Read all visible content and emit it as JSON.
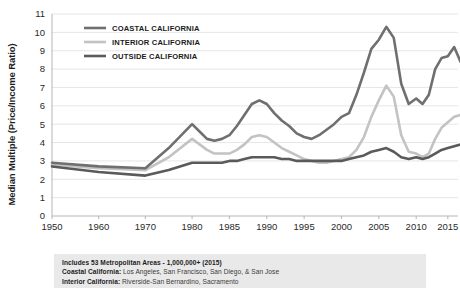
{
  "chart_data": {
    "type": "line",
    "title": "",
    "xlabel": "",
    "ylabel": "Median Multiple (Price/Income Ratio)",
    "ylim": [
      0,
      11
    ],
    "ytick_labels": [
      "0",
      "1",
      "2",
      "3",
      "4",
      "5",
      "6",
      "7",
      "8",
      "9",
      "10",
      "11"
    ],
    "ytick_values": [
      0,
      1,
      2,
      3,
      4,
      5,
      6,
      7,
      8,
      9,
      10,
      11
    ],
    "xtick_labels": [
      "1950",
      "1960",
      "1970",
      "1980",
      "1985",
      "1990",
      "1995",
      "2000",
      "2005",
      "2010",
      "2015"
    ],
    "xtick_values": [
      1950,
      1960,
      1970,
      1980,
      1985,
      1990,
      1995,
      2000,
      2005,
      2010,
      2015
    ],
    "xlim": [
      1950,
      2017
    ],
    "grid": true,
    "legend_position": "top-left",
    "x": [
      1950,
      1960,
      1970,
      1975,
      1980,
      1981,
      1982,
      1983,
      1984,
      1985,
      1986,
      1987,
      1988,
      1989,
      1990,
      1991,
      1992,
      1993,
      1994,
      1995,
      1996,
      1997,
      1998,
      1999,
      2000,
      2001,
      2002,
      2003,
      2004,
      2005,
      2006,
      2007,
      2008,
      2009,
      2010,
      2011,
      2012,
      2013,
      2014,
      2015,
      2016,
      2017
    ],
    "series": [
      {
        "name": "COASTAL CALIFORNIA",
        "color": "#6f6f6f",
        "values": [
          2.9,
          2.7,
          2.6,
          3.7,
          5.0,
          4.6,
          4.2,
          4.1,
          4.2,
          4.4,
          4.9,
          5.5,
          6.1,
          6.3,
          6.1,
          5.6,
          5.2,
          4.9,
          4.5,
          4.3,
          4.2,
          4.4,
          4.7,
          5.0,
          5.4,
          5.6,
          6.6,
          7.8,
          9.1,
          9.6,
          10.3,
          9.7,
          7.2,
          6.1,
          6.4,
          6.1,
          6.6,
          8.0,
          8.6,
          8.7,
          9.2,
          8.4
        ]
      },
      {
        "name": "INTERIOR CALIFORNIA",
        "color": "#c3c3c3",
        "values": [
          2.8,
          2.6,
          2.5,
          3.2,
          4.2,
          3.9,
          3.6,
          3.4,
          3.4,
          3.4,
          3.6,
          3.9,
          4.3,
          4.4,
          4.3,
          4.0,
          3.7,
          3.5,
          3.3,
          3.1,
          3.0,
          2.9,
          2.9,
          3.0,
          3.1,
          3.2,
          3.6,
          4.3,
          5.4,
          6.3,
          7.1,
          6.5,
          4.4,
          3.5,
          3.4,
          3.2,
          3.4,
          4.2,
          4.8,
          5.1,
          5.4,
          5.5
        ]
      },
      {
        "name": "OUTSIDE CALIFORNIA",
        "color": "#5a5a5a",
        "values": [
          2.7,
          2.4,
          2.2,
          2.5,
          2.9,
          2.9,
          2.9,
          2.9,
          2.9,
          3.0,
          3.0,
          3.1,
          3.2,
          3.2,
          3.2,
          3.2,
          3.1,
          3.1,
          3.0,
          3.0,
          3.0,
          3.0,
          3.0,
          3.0,
          3.0,
          3.1,
          3.2,
          3.3,
          3.5,
          3.6,
          3.7,
          3.5,
          3.2,
          3.1,
          3.2,
          3.1,
          3.2,
          3.4,
          3.6,
          3.7,
          3.8,
          3.9
        ]
      }
    ]
  },
  "legend": {
    "entries": [
      {
        "label": "COASTAL CALIFORNIA",
        "color": "#6f6f6f"
      },
      {
        "label": "INTERIOR CALIFORNIA",
        "color": "#c3c3c3"
      },
      {
        "label": "OUTSIDE CALIFORNIA",
        "color": "#5a5a5a"
      }
    ]
  },
  "footnote": {
    "line1": "Includes 53 Metropolitan Areas - 1,000,000+ (2015)",
    "line2_label": "Coastal California:",
    "line2_value": "Los Angeles, San Francisco, San Diego, & San Jose",
    "line3_label": "Interior California:",
    "line3_value": "Riverside-San Bernardino, Sacramento"
  },
  "colors": {
    "grid": "#e0e0e0",
    "axis": "#b5b5b5",
    "footnote_bg": "#e9e9e9",
    "text": "#1c1c1c"
  }
}
